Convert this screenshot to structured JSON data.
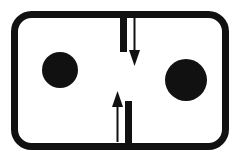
{
  "figure": {
    "type": "schematic-diagram",
    "title": "",
    "caption": "",
    "width": 238,
    "height": 161,
    "background_color": "#ffffff",
    "ink_color": "#111111"
  },
  "chamber": {
    "shape": "rounded-rectangle",
    "x": 14.5,
    "y": 14.5,
    "width": 211,
    "height": 132,
    "corner_radius": 17,
    "stroke_width": 7,
    "fill": "none",
    "stroke_color": "#111111"
  },
  "particles": [
    {
      "id": "left-particle",
      "cx": 60,
      "cy": 70,
      "r": 18,
      "fill": "#111111"
    },
    {
      "id": "right-particle",
      "cx": 186,
      "cy": 80,
      "r": 21,
      "fill": "#111111"
    }
  ],
  "partition": {
    "gap_top_y": 52,
    "gap_bottom_y": 101,
    "stroke_width": 7,
    "segments": [
      {
        "id": "upper-partition-stub",
        "x": 123.5,
        "y1": 14,
        "y2": 52
      },
      {
        "id": "lower-partition-stub",
        "x": 128.5,
        "y1": 101,
        "y2": 147
      }
    ]
  },
  "arrows": [
    {
      "id": "downward-flow-arrow",
      "direction": "down",
      "x": 134.5,
      "tail_y": 17,
      "head_y": 66,
      "shaft_width": 2,
      "head_width": 11,
      "head_length": 16,
      "color": "#111111"
    },
    {
      "id": "upward-flow-arrow",
      "direction": "up",
      "x": 117.5,
      "tail_y": 142,
      "head_y": 91,
      "shaft_width": 2,
      "head_width": 11,
      "head_length": 16,
      "color": "#111111"
    }
  ],
  "labels": {
    "none_present": ""
  }
}
